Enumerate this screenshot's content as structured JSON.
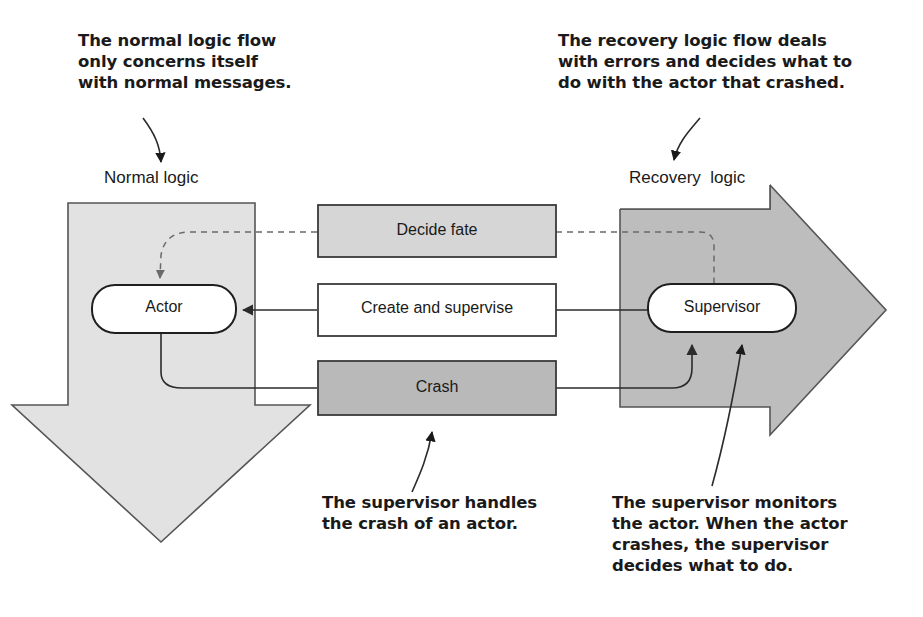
{
  "diagram": {
    "colors": {
      "page_background": "#ffffff",
      "flow_arrow_left_fill": "#e2e2e2",
      "flow_arrow_right_fill": "#bdbdbd",
      "box_light_fill": "#d6d6d6",
      "box_dark_fill": "#b9b9b9",
      "box_white_fill": "#ffffff",
      "stroke": "#3a3a3a",
      "text": "#1a1a1a"
    },
    "callouts": [
      {
        "id": "normal",
        "text": "The normal logic flow\nonly concerns itself\nwith normal messages."
      },
      {
        "id": "recovery",
        "text": "The recovery logic flow deals\nwith errors and decides what to\ndo with the actor that crashed."
      },
      {
        "id": "crash",
        "text": "The supervisor handles\nthe crash of an actor."
      },
      {
        "id": "monitor",
        "text": "The supervisor monitors\nthe actor. When the actor\ncrashes, the supervisor\ndecides what to do."
      }
    ],
    "flows": [
      {
        "id": "normal-logic",
        "label": "Normal logic",
        "direction": "down",
        "fill": "#e2e2e2"
      },
      {
        "id": "recovery-logic",
        "label": "Recovery  logic",
        "direction": "right",
        "fill": "#bdbdbd"
      }
    ],
    "nodes": [
      {
        "id": "actor",
        "label": "Actor",
        "shape": "rounded-rect",
        "fill": "#ffffff"
      },
      {
        "id": "supervisor",
        "label": "Supervisor",
        "shape": "rounded-rect",
        "fill": "#ffffff"
      }
    ],
    "message_boxes": [
      {
        "id": "decide-fate",
        "label": "Decide fate",
        "fill": "#d6d6d6",
        "link_style": "dashed",
        "link_direction": "supervisor-to-actor"
      },
      {
        "id": "create-and-supervise",
        "label": "Create and supervise",
        "fill": "#ffffff",
        "link_style": "solid",
        "link_direction": "supervisor-to-actor"
      },
      {
        "id": "crash",
        "label": "Crash",
        "fill": "#b9b9b9",
        "link_style": "solid",
        "link_direction": "actor-to-supervisor"
      }
    ]
  }
}
